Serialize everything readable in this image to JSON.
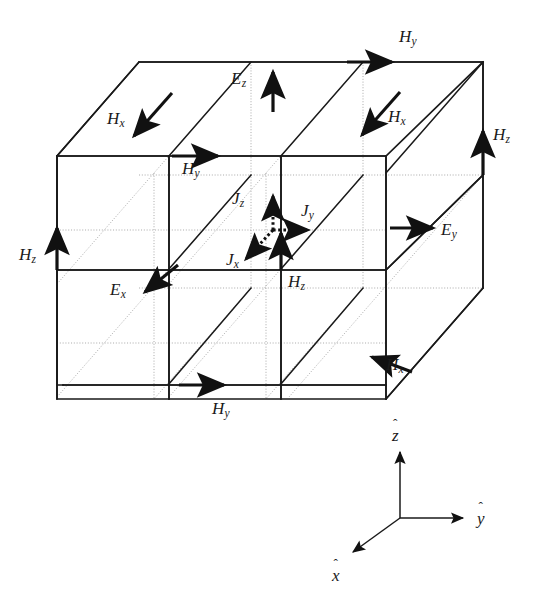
{
  "figure": {
    "kind": "yee-cell-3d-diagram",
    "caption": "",
    "background_color": "#ffffff",
    "line_color": "#1a1a1a",
    "hidden_line_color": "#9a9a9a",
    "arrow_color": "#111111"
  },
  "geometry": {
    "projection": "oblique",
    "cells_per_axis": 2,
    "y_step_px": 112,
    "z_step_px": 113,
    "x_step_vector_px": [
      -97,
      111
    ],
    "origin_back_top_left_px": [
      251,
      62
    ]
  },
  "labels": [
    {
      "id": "H_x_top_left",
      "base": "H",
      "sub": "x",
      "x": 107,
      "y": 110
    },
    {
      "id": "E_z_top",
      "base": "E",
      "sub": "z",
      "x": 231,
      "y": 70
    },
    {
      "id": "H_y_top_right",
      "base": "H",
      "sub": "y",
      "x": 399,
      "y": 28
    },
    {
      "id": "H_x_mid_right",
      "base": "H",
      "sub": "x",
      "x": 388,
      "y": 108
    },
    {
      "id": "H_z_right",
      "base": "H",
      "sub": "z",
      "x": 493,
      "y": 126
    },
    {
      "id": "H_y_mid_left",
      "base": "H",
      "sub": "y",
      "x": 182,
      "y": 160
    },
    {
      "id": "J_z_center",
      "base": "J",
      "sub": "z",
      "x": 232,
      "y": 190
    },
    {
      "id": "J_y_center",
      "base": "J",
      "sub": "y",
      "x": 301,
      "y": 202
    },
    {
      "id": "E_y_right",
      "base": "E",
      "sub": "y",
      "x": 441,
      "y": 221
    },
    {
      "id": "H_z_left",
      "base": "H",
      "sub": "z",
      "x": 19,
      "y": 246
    },
    {
      "id": "J_x_center",
      "base": "J",
      "sub": "x",
      "x": 226,
      "y": 251
    },
    {
      "id": "E_x_left",
      "base": "E",
      "sub": "x",
      "x": 110,
      "y": 281
    },
    {
      "id": "H_z_center",
      "base": "H",
      "sub": "z",
      "x": 288,
      "y": 273
    },
    {
      "id": "H_x_bottom_right",
      "base": "H",
      "sub": "x",
      "x": 386,
      "y": 356
    },
    {
      "id": "H_y_bottom",
      "base": "H",
      "sub": "y",
      "x": 212,
      "y": 400
    }
  ],
  "axis_triad": {
    "origin_px": [
      400,
      518
    ],
    "axes": [
      {
        "id": "z-axis",
        "label": "z",
        "tip_px": [
          400,
          447
        ],
        "label_px": [
          392,
          427
        ]
      },
      {
        "id": "y-axis",
        "label": "y",
        "tip_px": [
          468,
          518
        ],
        "label_px": [
          477,
          510
        ]
      },
      {
        "id": "x-axis",
        "label": "x",
        "tip_px": [
          348,
          556
        ],
        "label_px": [
          332,
          567
        ]
      }
    ]
  },
  "field_vectors": [
    {
      "id": "H_x_top_left",
      "symbol": "H",
      "component": "x",
      "style": "solid",
      "direction": "down-left"
    },
    {
      "id": "E_z_top",
      "symbol": "E",
      "component": "z",
      "style": "solid",
      "direction": "up"
    },
    {
      "id": "H_y_top_right",
      "symbol": "H",
      "component": "y",
      "style": "solid",
      "direction": "right"
    },
    {
      "id": "H_x_mid_right",
      "symbol": "H",
      "component": "x",
      "style": "solid",
      "direction": "down-left"
    },
    {
      "id": "H_z_right",
      "symbol": "H",
      "component": "z",
      "style": "solid",
      "direction": "up"
    },
    {
      "id": "H_y_mid_left",
      "symbol": "H",
      "component": "y",
      "style": "solid",
      "direction": "right"
    },
    {
      "id": "J_z_center",
      "symbol": "J",
      "component": "z",
      "style": "dotted",
      "direction": "up"
    },
    {
      "id": "J_y_center",
      "symbol": "J",
      "component": "y",
      "style": "dotted",
      "direction": "right"
    },
    {
      "id": "J_x_center",
      "symbol": "J",
      "component": "x",
      "style": "dotted",
      "direction": "down-left"
    },
    {
      "id": "E_y_right",
      "symbol": "E",
      "component": "y",
      "style": "solid",
      "direction": "right"
    },
    {
      "id": "H_z_left",
      "symbol": "H",
      "component": "z",
      "style": "solid",
      "direction": "up"
    },
    {
      "id": "E_x_left",
      "symbol": "E",
      "component": "x",
      "style": "solid",
      "direction": "down-left"
    },
    {
      "id": "H_z_center",
      "symbol": "H",
      "component": "z",
      "style": "solid",
      "direction": "up"
    },
    {
      "id": "H_x_bottom_right",
      "symbol": "H",
      "component": "x",
      "style": "solid",
      "direction": "down-left"
    },
    {
      "id": "H_y_bottom",
      "symbol": "H",
      "component": "y",
      "style": "solid",
      "direction": "right"
    }
  ]
}
